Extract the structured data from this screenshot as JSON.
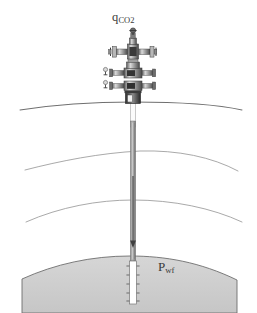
{
  "diagram": {
    "background_color": "#ffffff",
    "labels": {
      "injection_rate": {
        "symbol": "q",
        "subscript": "CO",
        "subscript_2": "2",
        "full": "q_CO2",
        "meaning": "CO2 injection rate",
        "color": "#3a3a3a"
      },
      "bottomhole_pressure": {
        "symbol": "P",
        "subscript": "wf",
        "full": "P_wf",
        "meaning": "bottomhole flowing pressure",
        "color": "#3a3a3a"
      }
    },
    "colors": {
      "reservoir_fill": "#cdcdcd",
      "reservoir_outline": "#6e6e6e",
      "layer_line": "#8f8f8f",
      "ground_line": "#7a7a7a",
      "tubing_fill": "#a8a8a8",
      "tubing_edge": "#6a6a6a",
      "casing_white": "#ffffff",
      "wellhead_dark": "#3b3b3b",
      "wellhead_mid": "#8a8a8a",
      "wellhead_light": "#d2d2d2",
      "arrow": "#4a4a4a",
      "text": "#3a3a3a"
    },
    "geology": {
      "ground_surface": {
        "name": "ground surface",
        "y_at_well": 103,
        "type": "curve"
      },
      "layers": [
        {
          "name": "overburden layer boundary 1",
          "y_at_well": 152,
          "type": "curve"
        },
        {
          "name": "overburden layer boundary 2",
          "y_at_well": 202,
          "type": "curve"
        }
      ],
      "reservoir": {
        "name": "storage reservoir",
        "crest_y": 258,
        "base_y": 313,
        "fill": "#cdcdcd"
      }
    },
    "wellbore": {
      "center_x": 133,
      "top_y": 103,
      "bottom_y": 305,
      "tubing_width": 5,
      "flow_direction": "downward",
      "arrow": {
        "from_y": 180,
        "to_y": 245,
        "direction": "down"
      },
      "perforated_interval": {
        "top_y": 262,
        "bottom_y": 303,
        "open_hole": true,
        "perforation_count": 5
      }
    },
    "wellhead": {
      "name": "christmas tree",
      "center_x": 133,
      "top_y": 28,
      "bottom_y": 103,
      "components": [
        {
          "name": "swab-valve-cap",
          "y": 30
        },
        {
          "name": "upper-master-stem",
          "y": 40
        },
        {
          "name": "cross-flow-tee",
          "y": 52
        },
        {
          "name": "wing-valve-left",
          "y": 52
        },
        {
          "name": "wing-valve-right",
          "y": 52
        },
        {
          "name": "master-valve-upper",
          "y": 72
        },
        {
          "name": "side-outlet-valve-upper",
          "y": 72
        },
        {
          "name": "master-valve-lower",
          "y": 86
        },
        {
          "name": "side-outlet-valve-lower",
          "y": 86
        },
        {
          "name": "casing-head-spool",
          "y": 98
        }
      ]
    }
  }
}
